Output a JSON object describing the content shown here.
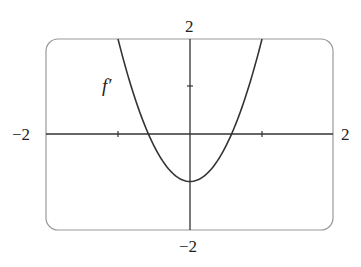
{
  "chart_data": {
    "type": "line",
    "title": "",
    "series": [
      {
        "name": "f'",
        "formula": "3x^2 - 1",
        "x": [
          -1,
          -0.8,
          -0.6,
          -0.577,
          -0.4,
          -0.2,
          0,
          0.2,
          0.4,
          0.577,
          0.6,
          0.8,
          1
        ],
        "values": [
          2,
          0.92,
          0.08,
          0,
          -0.52,
          -0.88,
          -1,
          -0.88,
          -0.52,
          0,
          0.08,
          0.92,
          2
        ]
      }
    ],
    "xlim": [
      -2,
      2
    ],
    "ylim": [
      -2,
      2
    ],
    "xlabel": "",
    "ylabel": "",
    "tick_labels": {
      "x_min": "−2",
      "x_max": "2",
      "y_min": "−2",
      "y_max": "2"
    },
    "ticks": {
      "x": [
        -1,
        1
      ],
      "y": [
        1
      ]
    },
    "curve_label": "f′",
    "grid": false,
    "legend": "none"
  }
}
